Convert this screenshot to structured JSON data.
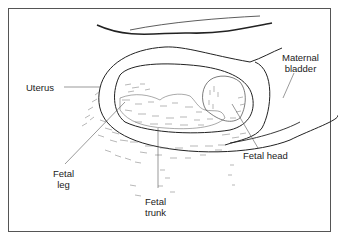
{
  "diagram": {
    "type": "ultrasound-anatomy-sketch",
    "labels": {
      "uterus": "Uterus",
      "maternal_bladder_line1": "Maternal",
      "maternal_bladder_line2": "bladder",
      "fetal_leg_line1": "Fetal",
      "fetal_leg_line2": "leg",
      "fetal_trunk_line1": "Fetal",
      "fetal_trunk_line2": "trunk",
      "fetal_head": "Fetal head"
    },
    "colors": {
      "line": "#222222",
      "frame": "#555555",
      "hatching": "#888888",
      "background": "#ffffff"
    }
  }
}
